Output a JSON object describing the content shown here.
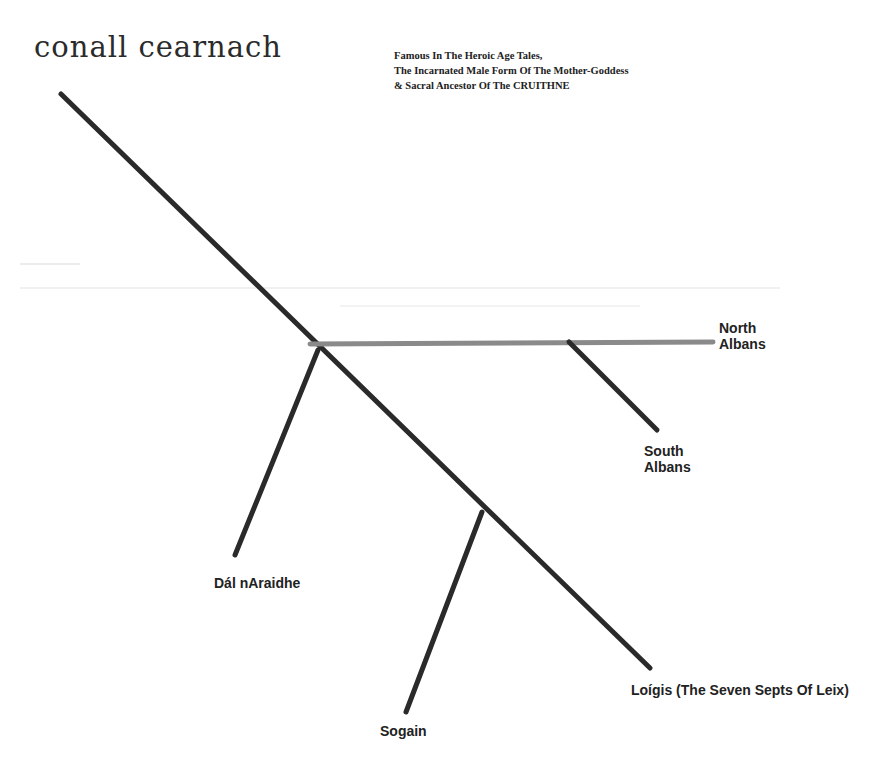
{
  "title": "conall cearnach",
  "subtitle": {
    "lines": [
      "Famous In The Heroic Age Tales,",
      "The Incarnated Male Form Of The Mother-Goddess",
      "& Sacral Ancestor Of The CRUITHNE"
    ]
  },
  "branches": {
    "north_albans": {
      "line1": "North",
      "line2": "Albans"
    },
    "south_albans": {
      "line1": "South",
      "line2": "Albans"
    },
    "dal_naraidhe": "Dál nAraidhe",
    "loigis": "Loígis (The Seven Septs Of Leix)",
    "sogain": "Sogain"
  },
  "colors": {
    "line": "#2a2a2a",
    "horizontal_line": "#8a8a8a",
    "background": "#ffffff"
  }
}
